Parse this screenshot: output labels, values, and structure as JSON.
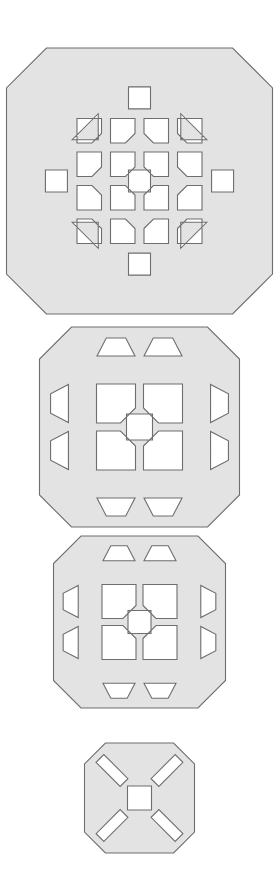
{
  "figure": {
    "title": "",
    "background_color": "#ffffff",
    "fill_color": "#e3e3e3",
    "stroke_color": "#6e6e6e",
    "stroke_width": 1.1,
    "canvas": {
      "width": 278,
      "height": 893
    },
    "shape_count": 4
  },
  "shapes": [
    {
      "name": "lattice-large",
      "index": 1,
      "label": "Largest octagonal lattice",
      "center": {
        "x": 139.5,
        "y": 181
      },
      "radius": 133,
      "chamfer": 0.3,
      "grid": 4,
      "cell_pitch": 33.5,
      "hole_size": 24.5,
      "chamfer_cut": 9.5,
      "center_square": 22,
      "edge_square": 22,
      "corner_triangle": 26,
      "bounds": {
        "x": 17,
        "y": 48,
        "width": 245,
        "height": 266
      }
    },
    {
      "name": "lattice-medium",
      "index": 2,
      "label": "Medium octagonal lattice",
      "center": {
        "x": 139.5,
        "y": 427
      },
      "radius": 100,
      "chamfer": 0.32,
      "grid": 2,
      "cell_pitch": 47,
      "hole_size": 39,
      "chamfer_cut": 15,
      "center_square": 26,
      "edge_trapezoid": 38,
      "corner_triangle": 30,
      "bounds": {
        "x": 40,
        "y": 333,
        "width": 199,
        "height": 190
      }
    },
    {
      "name": "lattice-small",
      "index": 3,
      "label": "Small octagonal lattice",
      "center": {
        "x": 139.5,
        "y": 622
      },
      "radius": 86,
      "chamfer": 0.32,
      "grid": 2,
      "cell_pitch": 41,
      "hole_size": 34,
      "chamfer_cut": 13,
      "center_square": 23,
      "edge_trapezoid": 32,
      "corner_triangle": 26,
      "bounds": {
        "x": 54,
        "y": 537,
        "width": 171,
        "height": 170
      }
    },
    {
      "name": "lattice-tiny",
      "index": 4,
      "label": "Smallest octagonal lattice",
      "center": {
        "x": 139.5,
        "y": 798
      },
      "radius": 55,
      "chamfer": 0.38,
      "grid": 1,
      "slot_length": 34,
      "slot_width": 11,
      "center_square": 24,
      "bounds": {
        "x": 85,
        "y": 743,
        "width": 109,
        "height": 110
      }
    }
  ]
}
